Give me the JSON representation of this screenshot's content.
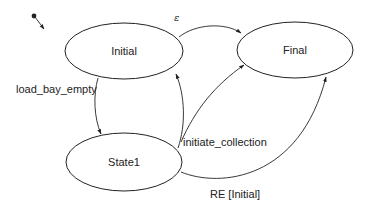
{
  "diagram": {
    "type": "state-machine",
    "states": [
      {
        "id": "initial",
        "label": "Initial",
        "cx": 124,
        "cy": 51,
        "rx": 59,
        "ry": 28
      },
      {
        "id": "final",
        "label": "Final",
        "cx": 295,
        "cy": 50,
        "rx": 58,
        "ry": 28
      },
      {
        "id": "state1",
        "label": "State1",
        "cx": 124,
        "cy": 162,
        "rx": 58,
        "ry": 29
      }
    ],
    "start_marker": {
      "from": [
        34,
        16
      ],
      "to": "initial"
    },
    "transitions": [
      {
        "id": "t-epsilon",
        "from": "initial",
        "to": "final",
        "label": "ε"
      },
      {
        "id": "t-load-bay-empty",
        "from": "initial",
        "to": "state1",
        "label": "load_bay_empty"
      },
      {
        "id": "t-state1-initial",
        "from": "state1",
        "to": "initial",
        "label": ""
      },
      {
        "id": "t-initiate-collection",
        "from": "state1",
        "to": "final",
        "label": "initiate_collection"
      },
      {
        "id": "t-re-initial",
        "from": "state1",
        "to": "final",
        "label": "RE [Initial]"
      }
    ],
    "colors": {
      "stroke": "#222222",
      "fill": "#ffffff",
      "background": "#ffffff",
      "text": "#222222"
    }
  },
  "labels": {
    "initial": "Initial",
    "final": "Final",
    "state1": "State1",
    "epsilon": "ε",
    "load_bay_empty": "load_bay_empty",
    "initiate_collection": "initiate_collection",
    "re_initial": "RE [Initial]"
  }
}
